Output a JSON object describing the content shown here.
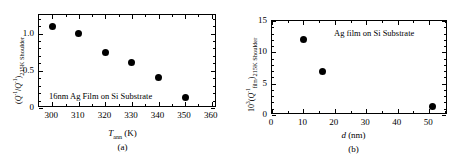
{
  "figure": {
    "panels": [
      {
        "id": "a",
        "label": "(a)",
        "annotation": "16nm Ag Film on Si Substrate",
        "xlabel_main": "T",
        "xlabel_sub": "ann",
        "xlabel_unit": " (K)",
        "ylabel": "(Q-1/Q-1)215K Shoulder",
        "xticks": [
          "300",
          "310",
          "320",
          "330",
          "340",
          "350",
          "360"
        ],
        "yticks": [
          "0",
          "0.5",
          "1.0"
        ]
      },
      {
        "id": "b",
        "label": "(b)",
        "annotation": "Ag film on Si Substrate",
        "xlabel_main": "d",
        "xlabel_unit": " (nm)",
        "ylabel": "103(Q-1film)215K Shoulder",
        "xticks": [
          "0",
          "10",
          "20",
          "30",
          "40",
          "50"
        ],
        "yticks": [
          "0",
          "5",
          "10",
          "15"
        ]
      }
    ]
  },
  "chart_data": [
    {
      "type": "scatter",
      "panel": "a",
      "title": "",
      "annotation": "16nm Ag Film on Si Substrate",
      "xlabel": "T_ann (K)",
      "ylabel": "(Q^-1 / Q^-1)_215K Shoulder",
      "xlim": [
        295,
        362
      ],
      "ylim": [
        0,
        1.25
      ],
      "xticks": [
        300,
        310,
        320,
        330,
        340,
        350,
        360
      ],
      "yticks": [
        0,
        0.5,
        1.0
      ],
      "grid": false,
      "legend": "none",
      "marker": "filled-circle",
      "x": [
        300,
        310,
        320,
        330,
        340,
        350
      ],
      "y": [
        1.1,
        1.0,
        0.74,
        0.61,
        0.41,
        0.14
      ]
    },
    {
      "type": "scatter",
      "panel": "b",
      "title": "",
      "annotation": "Ag film on Si Substrate",
      "xlabel": "d (nm)",
      "ylabel": "10^3 (Q^-1_film)_215K Shoulder",
      "xlim": [
        0,
        56
      ],
      "ylim": [
        0,
        15
      ],
      "xticks": [
        0,
        10,
        20,
        30,
        40,
        50
      ],
      "yticks": [
        0,
        5,
        10,
        15
      ],
      "grid": false,
      "legend": "none",
      "marker": "filled-circle",
      "x": [
        10,
        16,
        51
      ],
      "y": [
        12.0,
        6.9,
        1.4
      ]
    }
  ]
}
